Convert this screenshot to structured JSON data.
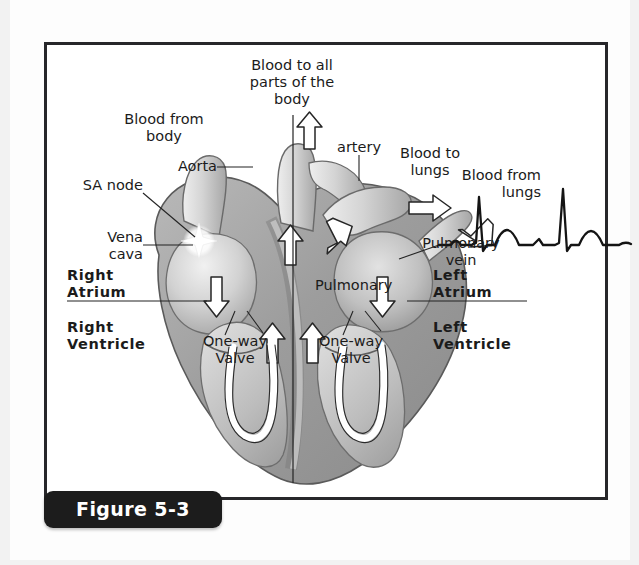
{
  "figure": {
    "caption": "Figure 5-3",
    "panel_border_color": "#27272a",
    "caption_tab_color": "#1c1c1c"
  },
  "diagram": {
    "labels": {
      "blood_to_body": "Blood to all\nparts of the\nbody",
      "blood_from_body": "Blood from\nbody",
      "sa_node": "SA node",
      "vena_cava": "Vena\ncava",
      "aorta": "Aorta",
      "artery": "artery",
      "blood_to_lungs": "Blood to\nlungs",
      "blood_from_lungs": "Blood from\nlungs",
      "pulmonary_vein": "Pulmonary\nvein",
      "pulmonary": "Pulmonary",
      "right_atrium": "Right\nAtrium",
      "right_ventricle": "Right\nVentricle",
      "left_atrium": "Left\nAtrium",
      "left_ventricle": "Left\nVentricle",
      "one_way_valve_right": "One-way\nValve",
      "one_way_valve_left": "One-way\nValve"
    },
    "colors": {
      "muscle_dark": "#8f8f8f",
      "muscle_mid": "#b0b0b0",
      "muscle_light": "#cfcfcf",
      "chamber_light": "#dedede",
      "vessel_light": "#d8d8d8",
      "outline": "#4a4a4a",
      "arrow_fill": "#ffffff",
      "arrow_stroke": "#262626",
      "ecg_stroke": "#141414",
      "text": "#1b1b1b"
    },
    "ecg": {
      "label": "electrocardiogram-trace",
      "beats": 2,
      "features": [
        "P wave",
        "QRS spike",
        "T wave"
      ]
    }
  }
}
